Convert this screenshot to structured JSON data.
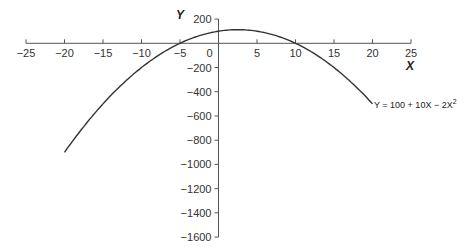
{
  "chart_data": {
    "type": "line",
    "title": "",
    "xlabel": "X",
    "ylabel": "Y",
    "xlim": [
      -25,
      25
    ],
    "ylim": [
      -1600,
      200
    ],
    "x_ticks": [
      -25,
      -20,
      -15,
      -10,
      -5,
      0,
      5,
      10,
      15,
      20,
      25
    ],
    "y_ticks": [
      200,
      -200,
      -400,
      -600,
      -800,
      -1000,
      -1200,
      -1400,
      -1600
    ],
    "grid": false,
    "series": [
      {
        "name": "Y = 100 + 10X - 2X^2",
        "x": [
          -20,
          -15,
          -10,
          -5,
          0,
          2.5,
          5,
          10,
          15,
          20
        ],
        "values": [
          -900,
          -500,
          -200,
          0,
          100,
          112.5,
          100,
          0,
          -200,
          -500
        ]
      }
    ],
    "annotations": [
      {
        "text": "Y = 100 + 10X − 2X",
        "superscript": "2",
        "anchor_x": 20,
        "anchor_y": -500
      }
    ]
  },
  "labels": {
    "x_axis": "X",
    "y_axis": "Y",
    "equation_main": "Y = 100 + 10X − 2X",
    "equation_sup": "2"
  }
}
